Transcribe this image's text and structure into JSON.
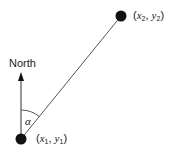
{
  "diagram": {
    "north_label": "North",
    "angle_label": "α",
    "point1": {
      "label_open": "(",
      "var_x": "x",
      "sub_x": "1",
      "sep": ", ",
      "var_y": "y",
      "sub_y": "1",
      "label_close": ")"
    },
    "point2": {
      "label_open": "(",
      "var_x": "x",
      "sub_x": "2",
      "sep": ", ",
      "var_y": "y",
      "sub_y": "2",
      "label_close": ")"
    },
    "colors": {
      "line": "#555555",
      "dot": "#111111",
      "text": "#222222"
    }
  }
}
